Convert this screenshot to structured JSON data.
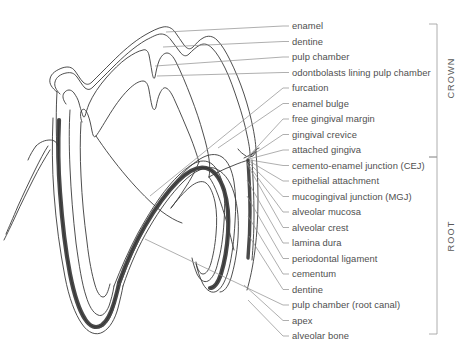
{
  "figure": {
    "type": "labelled-anatomical-diagram",
    "background_color": "#ffffff",
    "line_color": "#3a3a3a",
    "leader_color": "#8c8c8c",
    "text_color": "#4f4f4f",
    "shading_dark": "#4a4a4a"
  },
  "labels": [
    {
      "id": "enamel",
      "text": "enamel",
      "y": 26,
      "anchor_x": 166,
      "anchor_y": 32
    },
    {
      "id": "dentine-crown",
      "text": "dentine",
      "y": 41.5,
      "anchor_x": 163,
      "anchor_y": 47
    },
    {
      "id": "pulp-chamber",
      "text": "pulp chamber",
      "y": 57,
      "anchor_x": 155,
      "anchor_y": 66
    },
    {
      "id": "odontoblasts",
      "text": "odontbolasts lining pulp chamber",
      "y": 72.5,
      "anchor_x": 157,
      "anchor_y": 76
    },
    {
      "id": "furcation",
      "text": "furcation",
      "y": 88,
      "anchor_x": 150,
      "anchor_y": 196
    },
    {
      "id": "enamel-bulge",
      "text": "enamel bulge",
      "y": 103.5,
      "anchor_x": 218,
      "anchor_y": 148
    },
    {
      "id": "free-gingival-margin",
      "text": "free gingival margin",
      "y": 119,
      "anchor_x": 248,
      "anchor_y": 157
    },
    {
      "id": "gingival-crevice",
      "text": "gingival crevice",
      "y": 134.5,
      "anchor_x": 248,
      "anchor_y": 158
    },
    {
      "id": "attached-gingiva",
      "text": "attached gingiva",
      "y": 150,
      "anchor_x": 249,
      "anchor_y": 159
    },
    {
      "id": "cej",
      "text": "cemento-enamel junction (CEJ)",
      "y": 165.5,
      "anchor_x": 250,
      "anchor_y": 160
    },
    {
      "id": "epithelial-attachment",
      "text": "epithelial attachment",
      "y": 181,
      "anchor_x": 249,
      "anchor_y": 161
    },
    {
      "id": "mgj",
      "text": "mucogingival junction (MGJ)",
      "y": 196.5,
      "anchor_x": 248,
      "anchor_y": 162
    },
    {
      "id": "alveolar-mucosa",
      "text": "alveolar mucosa",
      "y": 212,
      "anchor_x": 247,
      "anchor_y": 163
    },
    {
      "id": "alveolar-crest",
      "text": "alveolar crest",
      "y": 227.5,
      "anchor_x": 247,
      "anchor_y": 164
    },
    {
      "id": "lamina-dura",
      "text": "lamina dura",
      "y": 243,
      "anchor_x": 247,
      "anchor_y": 180
    },
    {
      "id": "periodontal-ligament",
      "text": "periodontal ligament",
      "y": 258.5,
      "anchor_x": 247,
      "anchor_y": 196
    },
    {
      "id": "cementum",
      "text": "cementum",
      "y": 274,
      "anchor_x": 248,
      "anchor_y": 216
    },
    {
      "id": "dentine-root",
      "text": "dentine",
      "y": 289.5,
      "anchor_x": 249,
      "anchor_y": 236
    },
    {
      "id": "root-canal",
      "text": "pulp chamber (root canal)",
      "y": 305,
      "anchor_x": 145,
      "anchor_y": 239
    },
    {
      "id": "apex",
      "text": "apex",
      "y": 320.5,
      "anchor_x": 244,
      "anchor_y": 285
    },
    {
      "id": "alveolar-bone",
      "text": "alveolar bone",
      "y": 336,
      "anchor_x": 248,
      "anchor_y": 300
    }
  ],
  "brackets": [
    {
      "id": "crown",
      "text": "CROWN",
      "top": 24,
      "bottom": 157,
      "label_y": 78
    },
    {
      "id": "root",
      "text": "ROOT",
      "top": 157,
      "bottom": 334,
      "label_y": 236
    }
  ],
  "geometry": {
    "label_x": 292,
    "leader_end_x": 289,
    "bracket_x": 437,
    "bracket_tick": 8
  }
}
